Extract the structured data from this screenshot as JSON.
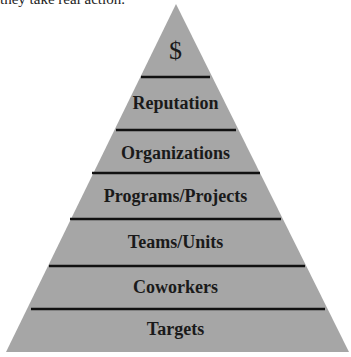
{
  "caption": "they take real action.",
  "pyramid": {
    "fill_color": "#a6a6a6",
    "line_color": "#111111",
    "levels": [
      {
        "label": "$",
        "top": 33
      },
      {
        "label": "Reputation",
        "top": 93
      },
      {
        "label": "Organizations",
        "top": 143
      },
      {
        "label": "Programs/Projects",
        "top": 186
      },
      {
        "label": "Teams/Units",
        "top": 232
      },
      {
        "label": "Coworkers",
        "top": 277
      },
      {
        "label": "Targets",
        "top": 319
      }
    ]
  }
}
